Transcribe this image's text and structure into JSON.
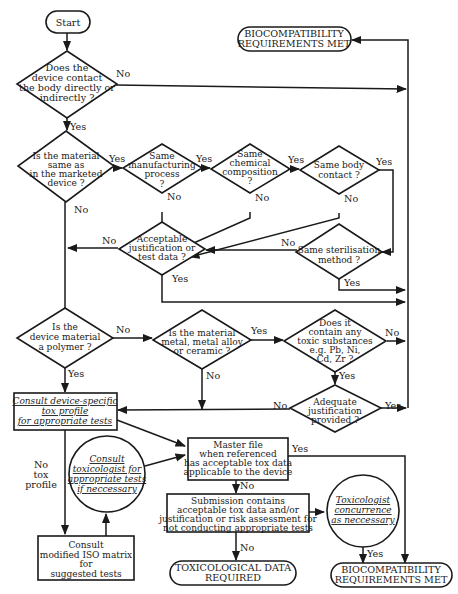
{
  "nodes": {
    "start": {
      "lines": [
        "Start"
      ]
    },
    "met_top": {
      "lines": [
        "BIOCOMPATIBILITY",
        "REQUIREMENTS MET"
      ]
    },
    "q_contact": {
      "lines": [
        "Does the",
        "device contact",
        "the body directly or",
        "indirectly ?"
      ]
    },
    "q_same_material": {
      "lines": [
        "Is the material",
        "same as",
        "in the marketed",
        "device ?"
      ]
    },
    "q_manufacturing": {
      "lines": [
        "Same",
        "manufacturing",
        "process",
        "?"
      ]
    },
    "q_chemical": {
      "lines": [
        "Same",
        "chemical",
        "composition",
        "?"
      ]
    },
    "q_body_contact": {
      "lines": [
        "Same body",
        "contact ?"
      ]
    },
    "q_acceptable": {
      "lines": [
        "Acceptable",
        "justification or",
        "test data ?"
      ]
    },
    "q_sterilisation": {
      "lines": [
        "Same sterilisation",
        "method ?"
      ]
    },
    "q_polymer": {
      "lines": [
        "Is the",
        "device material",
        "a polymer ?"
      ]
    },
    "q_metal": {
      "lines": [
        "Is the material",
        "metal, metal alloy",
        "or ceramic ?"
      ]
    },
    "q_toxic": {
      "lines": [
        "Does it",
        "contain any",
        "toxic substances",
        "e.g. Pb, Ni,",
        "Cd, Zr ?"
      ]
    },
    "q_adequate": {
      "lines": [
        "Adequate",
        "justification",
        "provided ?"
      ]
    },
    "consult_profile": {
      "lines": [
        "Consult device-specific",
        "tox profile",
        "for appropriate tests"
      ]
    },
    "master_file": {
      "lines": [
        "Master file",
        "when referenced",
        "has acceptable tox data",
        "applicable to the device"
      ]
    },
    "consult_toxicologist": {
      "lines": [
        "Consult",
        "toxicologist for",
        "appropriate tests",
        "if neccessary"
      ]
    },
    "submission": {
      "lines": [
        "Submission contains",
        "acceptable tox data and/or",
        "justification or risk assessment for",
        "not conducting appropriate tests"
      ]
    },
    "toxicologist_concurrence": {
      "lines": [
        "Toxicologist",
        "concurrence",
        "as neccessary"
      ]
    },
    "iso_matrix": {
      "lines": [
        "Consult",
        "modified ISO matrix",
        "for",
        "suggested tests"
      ]
    },
    "tox_required": {
      "lines": [
        "TOXICOLOGICAL DATA",
        "REQUIRED"
      ]
    },
    "met_bottom": {
      "lines": [
        "BIOCOMPATIBILITY",
        "REQUIREMENTS MET"
      ]
    }
  },
  "edge_labels": {
    "contact_no": "No",
    "contact_yes": "Yes",
    "same_material_yes": "Yes",
    "same_material_no": "No",
    "manufacturing_yes": "Yes",
    "manufacturing_no": "No",
    "chemical_yes": "Yes",
    "chemical_no": "No",
    "body_contact_yes": "Yes",
    "body_contact_no": "No",
    "acceptable_no": "No",
    "acceptable_yes": "Yes",
    "sterilisation_no": "No",
    "sterilisation_yes": "Yes",
    "polymer_no": "No",
    "polymer_yes": "Yes",
    "metal_yes": "Yes",
    "metal_no": "No",
    "toxic_no": "No",
    "toxic_yes": "Yes",
    "adequate_no": "No",
    "adequate_yes": "Yes",
    "no_tox_profile": [
      "No",
      "tox",
      "profile"
    ],
    "master_yes": "Yes",
    "master_no": "No",
    "submission_no": "No",
    "concurrence_yes": "Yes"
  }
}
